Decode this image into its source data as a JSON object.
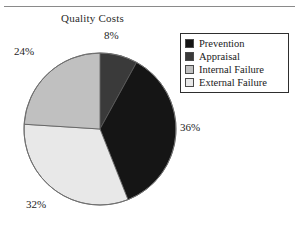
{
  "chart_data": {
    "type": "pie",
    "title": "Quality Costs",
    "categories": [
      "Prevention",
      "Appraisal",
      "Internal Failure",
      "External Failure"
    ],
    "values": [
      36,
      8,
      24,
      32
    ],
    "value_labels": [
      "36%",
      "8%",
      "24%",
      "32%"
    ],
    "unit": "%",
    "colors": [
      "#151515",
      "#3a3a3a",
      "#c0c0c0",
      "#e8e8e8"
    ],
    "start_angle_deg": 0,
    "direction": "clockwise",
    "legend_position": "right",
    "legend_border": true,
    "grid": false,
    "xlabel": "",
    "ylabel": ""
  },
  "title": "Quality Costs",
  "labels": {
    "prevention_pct": "36%",
    "appraisal_pct": "8%",
    "internal_pct": "24%",
    "external_pct": "32%"
  },
  "legend": {
    "items": [
      {
        "label": "Prevention",
        "color": "#151515"
      },
      {
        "label": "Appraisal",
        "color": "#3a3a3a"
      },
      {
        "label": "Internal Failure",
        "color": "#c0c0c0"
      },
      {
        "label": "External Failure",
        "color": "#e8e8e8"
      }
    ]
  }
}
